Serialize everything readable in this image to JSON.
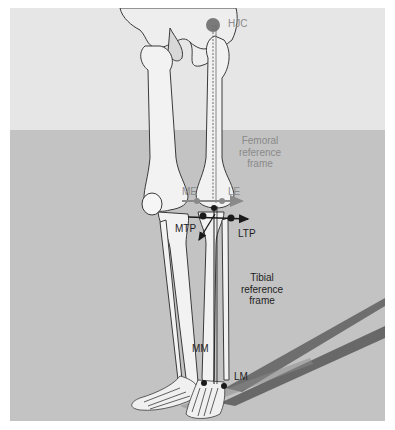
{
  "figure": {
    "background": {
      "upper": "#e6e6e6",
      "lower": "#c3c3c3",
      "horizon_y": 122
    },
    "colors": {
      "bone_fill": "#f4f4f4",
      "bone_stroke": "#3a3a3a",
      "landmark": "#1a1a1a",
      "femoral_axis": "#8a8a8a",
      "tibial_axis": "#1a1a1a",
      "shadow": "#4a4a4a"
    }
  },
  "labels": {
    "hjc": "HJC",
    "femoral_frame": [
      "Femoral",
      "reference",
      "frame"
    ],
    "me": "ME",
    "le": "LE",
    "mtp": "MTP",
    "ltp": "LTP",
    "tibial_frame": [
      "Tibial",
      "reference",
      "frame"
    ],
    "mm": "MM",
    "lm": "LM"
  },
  "landmarks": [
    {
      "id": "HJC",
      "name": "Hip joint center",
      "x": 204,
      "y": 14
    },
    {
      "id": "ME",
      "name": "Medial epicondyle",
      "x": 187,
      "y": 193
    },
    {
      "id": "LE",
      "name": "Lateral epicondyle",
      "x": 212,
      "y": 193
    },
    {
      "id": "MTP",
      "name": "Medial tibial plateau",
      "x": 193,
      "y": 208
    },
    {
      "id": "LTP",
      "name": "Lateral tibial plateau",
      "x": 221,
      "y": 210
    },
    {
      "id": "MM",
      "name": "Medial malleolus",
      "x": 194,
      "y": 375
    },
    {
      "id": "LM",
      "name": "Lateral malleolus",
      "x": 214,
      "y": 378
    }
  ]
}
